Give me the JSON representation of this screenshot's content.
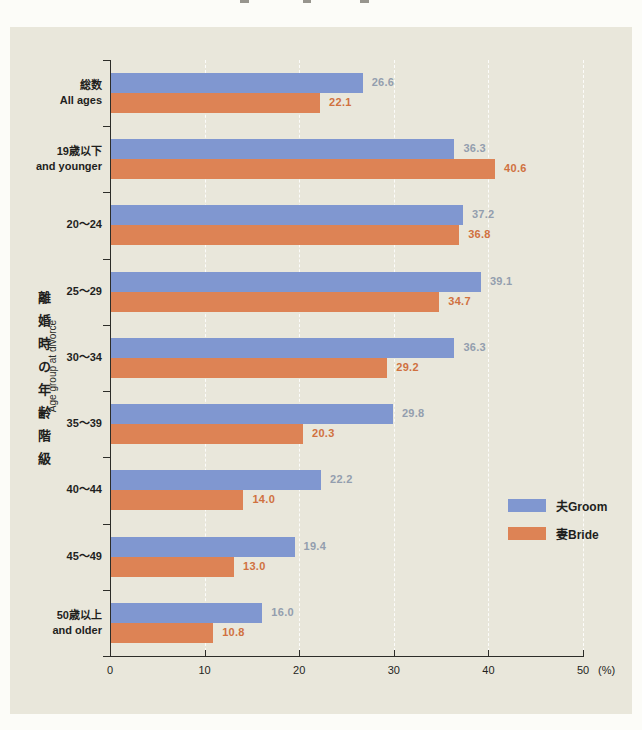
{
  "page": {
    "outer_background": "#fcfcf8",
    "panel_background": "#e9e7db",
    "note": "top edge shows only cut-off bottoms of an off-screen title"
  },
  "chart_data": {
    "type": "bar",
    "orientation": "horizontal",
    "title": "",
    "categories": [
      {
        "jp": "総数",
        "en": "All ages"
      },
      {
        "jp": "19歳以下",
        "en": "and younger"
      },
      {
        "jp": "20〜24",
        "en": ""
      },
      {
        "jp": "25〜29",
        "en": ""
      },
      {
        "jp": "30〜34",
        "en": ""
      },
      {
        "jp": "35〜39",
        "en": ""
      },
      {
        "jp": "40〜44",
        "en": ""
      },
      {
        "jp": "45〜49",
        "en": ""
      },
      {
        "jp": "50歳以上",
        "en": "and older"
      }
    ],
    "series": [
      {
        "name": "夫Groom",
        "color": "#8097d0",
        "label_color": "#939eae",
        "values": [
          26.6,
          36.3,
          37.2,
          39.1,
          36.3,
          29.8,
          22.2,
          19.4,
          16.0
        ]
      },
      {
        "name": "妻Bride",
        "color": "#dd8355",
        "label_color": "#d0713f",
        "values": [
          22.1,
          40.6,
          36.8,
          34.7,
          29.2,
          20.3,
          14.0,
          13.0,
          10.8
        ]
      }
    ],
    "x_axis": {
      "min": 0,
      "max": 50,
      "ticks": [
        0,
        10,
        20,
        30,
        40,
        50
      ],
      "unit_label": "(%)"
    },
    "y_axis": {
      "title_jp": "離婚時の年齢階級",
      "title_en": "Age group at divorce"
    },
    "legend": {
      "position": "middle-right"
    },
    "grid": "faint vertical dashed lines at each 10%",
    "value_labels": "shown right of each bar, one decimal"
  }
}
